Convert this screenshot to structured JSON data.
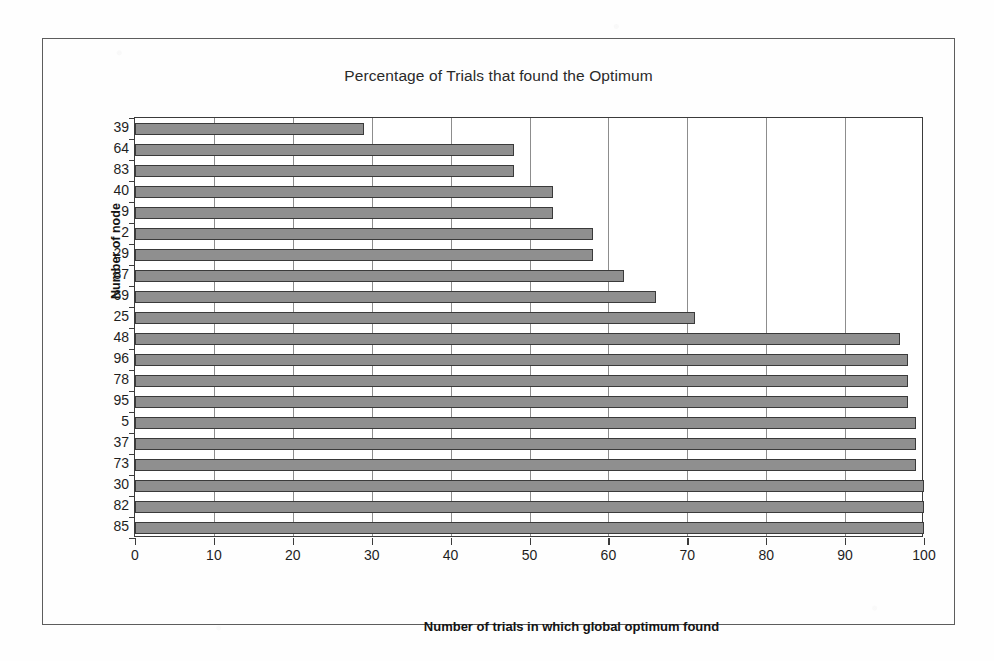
{
  "figure": {
    "title": "Percentage of Trials that found the Optimum",
    "y_axis_title": "Number of node",
    "x_axis_title": "Number of trials in which global optimum found"
  },
  "colors": {
    "bar_fill": "#8f8f8f",
    "bar_border": "#3a3a3a",
    "gridline": "#8d8d8d",
    "axis": "#3b3b3b",
    "frame": "#5d5d5d",
    "text": "#1e1e1e",
    "background": "#ffffff"
  },
  "chart_data": {
    "type": "bar",
    "orientation": "horizontal",
    "title": "Percentage of Trials that found the Optimum",
    "xlabel": "Number of trials in which global optimum found",
    "ylabel": "Number of node",
    "xlim": [
      0,
      100
    ],
    "xticks": [
      0,
      10,
      20,
      30,
      40,
      50,
      60,
      70,
      80,
      90,
      100
    ],
    "grid": "vertical",
    "legend": "none",
    "categories": [
      "39",
      "64",
      "83",
      "40",
      "9",
      "2",
      "29",
      "87",
      "69",
      "25",
      "48",
      "96",
      "78",
      "95",
      "5",
      "37",
      "73",
      "30",
      "82",
      "85"
    ],
    "values": [
      29,
      48,
      48,
      53,
      53,
      58,
      58,
      62,
      66,
      71,
      97,
      98,
      98,
      98,
      99,
      99,
      99,
      100,
      100,
      100
    ],
    "series": [
      {
        "name": "Number of trials in which global optimum found",
        "values": [
          29,
          48,
          48,
          53,
          53,
          58,
          58,
          62,
          66,
          71,
          97,
          98,
          98,
          98,
          99,
          99,
          99,
          100,
          100,
          100
        ]
      }
    ]
  }
}
